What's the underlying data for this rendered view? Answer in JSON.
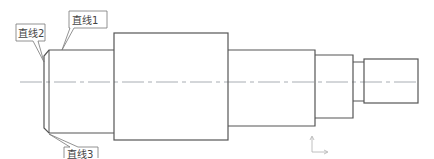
{
  "drawing": {
    "type": "shaft-outline",
    "stroke_color": "#555555",
    "centerline_color": "#9aa0a6",
    "callouts": [
      {
        "id": "line1",
        "label": "直线1"
      },
      {
        "id": "line2",
        "label": "直线2"
      },
      {
        "id": "line3",
        "label": "直线3"
      }
    ],
    "segments": [
      {
        "name": "chamfered-end",
        "x1": 44,
        "x2": 114,
        "y1": 50,
        "y2": 133
      },
      {
        "name": "collar",
        "x1": 114,
        "x2": 228,
        "y1": 33,
        "y2": 140
      },
      {
        "name": "journal",
        "x1": 228,
        "x2": 315,
        "y1": 50,
        "y2": 126
      },
      {
        "name": "step",
        "x1": 315,
        "x2": 353,
        "y1": 55,
        "y2": 118
      },
      {
        "name": "groove",
        "x1": 353,
        "x2": 364,
        "y1": 62,
        "y2": 101
      },
      {
        "name": "end-shaft",
        "x1": 364,
        "x2": 418,
        "y1": 59,
        "y2": 103
      }
    ]
  }
}
